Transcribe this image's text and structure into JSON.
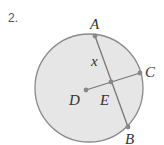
{
  "problem_number": "2.",
  "diagram": {
    "circle": {
      "cx": 89,
      "cy": 88,
      "r": 54,
      "fill": "#e6e6e6",
      "stroke": "#888888"
    },
    "points": {
      "A": {
        "label": "A",
        "x": 95,
        "y": 36
      },
      "B": {
        "label": "B",
        "x": 128,
        "y": 127
      },
      "C": {
        "label": "C",
        "x": 140,
        "y": 73
      },
      "D": {
        "label": "D",
        "x": 86,
        "y": 90
      },
      "E": {
        "label": "E",
        "x": 111,
        "y": 82
      }
    },
    "segments": [
      {
        "from": "A",
        "to": "B",
        "name": "chord AB"
      },
      {
        "from": "D",
        "to": "C",
        "name": "radius DC"
      }
    ],
    "variable_label": "x"
  }
}
